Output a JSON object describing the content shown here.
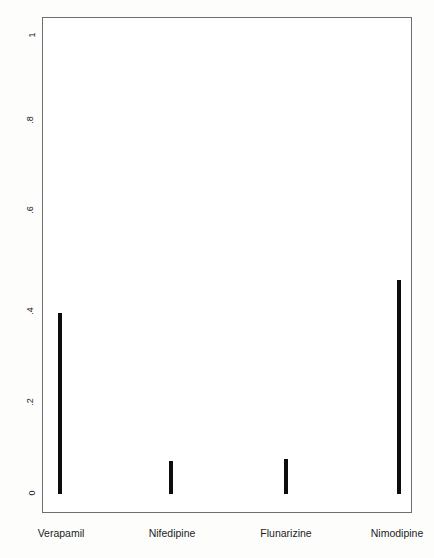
{
  "chart_data": {
    "type": "bar",
    "title": "",
    "subtitle": "",
    "xlabel": "",
    "ylabel": "",
    "categories": [
      "Verapamil",
      "Nifedipine",
      "Flunarizine",
      "Nimodipine"
    ],
    "values": [
      0.395,
      0.072,
      0.076,
      0.467
    ],
    "series": [
      {
        "name": "",
        "values": [
          0.395,
          0.072,
          0.076,
          0.467
        ]
      }
    ],
    "ylim": [
      0,
      1
    ],
    "yticks": [
      "0",
      ".2",
      ".4",
      ".6",
      ".8",
      "1"
    ],
    "ytick_values": [
      0,
      0.2,
      0.4,
      0.6,
      0.8,
      1
    ],
    "xticks": [
      "Verapamil",
      "Nifedipine",
      "Flunarizine",
      "Nimodipine"
    ],
    "grid": false,
    "legend": false,
    "legend_position": "none",
    "bar_color": "#0d0d0d",
    "frame_color": "#6f6f6f",
    "background_color": "#ffffff",
    "orientation": "vertical",
    "annotations": []
  }
}
